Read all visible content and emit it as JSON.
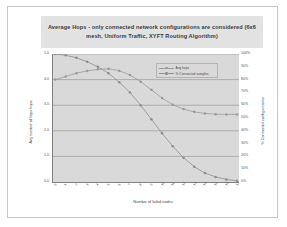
{
  "chart_data": {
    "type": "line",
    "title": "Average Hops - only connected network configurations are considered (6x6 mesh, Uniform Traffic, XYFT Routing Algorithm)",
    "xlabel": "Number of failed nodes",
    "ylabel": "Avg number of hops hops",
    "y2label": "% Connected configurations",
    "grid": true,
    "legend_position": "top-right",
    "x": [
      0,
      1,
      2,
      3,
      4,
      5,
      6,
      7,
      8,
      9,
      10,
      11,
      12,
      13,
      14,
      15,
      16,
      17
    ],
    "xticklabels": [
      "0",
      "1",
      "2",
      "3",
      "4",
      "5",
      "6",
      "7",
      "8",
      "9",
      "10",
      "11",
      "12",
      "13",
      "14",
      "15",
      "16",
      "17"
    ],
    "yticklabels": [
      "5.0",
      "4.0",
      "3.0",
      "2.0",
      "1.0",
      "0.0"
    ],
    "ylim": [
      0.0,
      5.0
    ],
    "y2ticklabels": [
      "100%",
      "90%",
      "80%",
      "70%",
      "60%",
      "50%",
      "40%",
      "30%",
      "20%",
      "10%",
      "0%"
    ],
    "y2lim": [
      0,
      100
    ],
    "series": [
      {
        "name": "Avg hops",
        "axis": "left",
        "color": "#9a9a9a",
        "values": [
          4.0,
          4.12,
          4.25,
          4.34,
          4.4,
          4.42,
          4.35,
          4.18,
          3.92,
          3.6,
          3.28,
          3.02,
          2.85,
          2.74,
          2.68,
          2.65,
          2.64,
          2.64
        ]
      },
      {
        "name": "% Connected samples",
        "axis": "right",
        "color": "#8e8e8e",
        "values": [
          100,
          99,
          97,
          94,
          90,
          85,
          78,
          70,
          60,
          49,
          38,
          28,
          19,
          12,
          7,
          4,
          2,
          1
        ]
      }
    ]
  },
  "legend": {
    "items": [
      {
        "label": "Avg hops",
        "color": "#9a9a9a"
      },
      {
        "label": "% Connected samples",
        "color": "#8e8e8e"
      }
    ]
  },
  "colors": {
    "plot_background": "#d9d9d9",
    "title_background": "#e2e2e2",
    "gridline": "#8f8f8f",
    "axis": "#808080",
    "frame": "#c8c8c8"
  }
}
